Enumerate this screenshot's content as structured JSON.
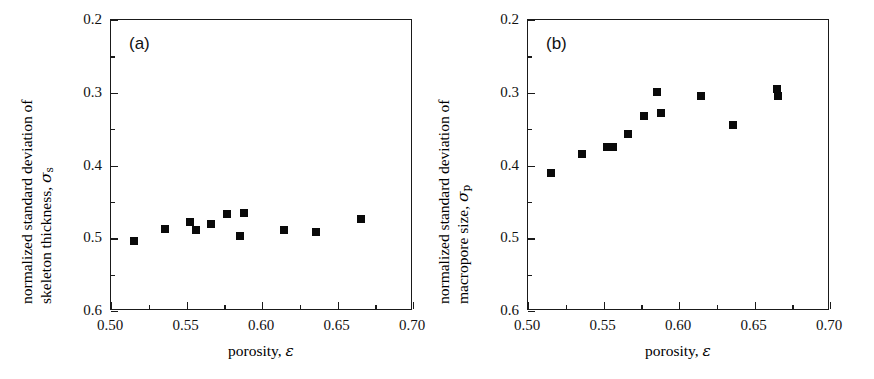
{
  "figure": {
    "background_color": "#ffffff",
    "marker_color": "#0a0a0a",
    "axis_color": "#1a1a1a"
  },
  "panels": [
    {
      "id": "a",
      "label": "(a)",
      "xlabel_prefix": "porosity, ",
      "xlabel_symbol": "ε",
      "ylabel_line1": "normalized standard deviation of",
      "ylabel_line2_prefix": "skeleton thickness, ",
      "ylabel_symbol": "σ",
      "ylabel_subscript": "s",
      "xticks": [
        "0.50",
        "0.55",
        "0.60",
        "0.65",
        "0.70"
      ],
      "yticks": [
        "0.6",
        "0.5",
        "0.4",
        "0.3",
        "0.2"
      ]
    },
    {
      "id": "b",
      "label": "(b)",
      "xlabel_prefix": "porosity, ",
      "xlabel_symbol": "ε",
      "ylabel_line1": "normalized standard deviation of",
      "ylabel_line2_prefix": "macropore size, ",
      "ylabel_symbol": "σ",
      "ylabel_subscript": "p",
      "xticks": [
        "0.50",
        "0.55",
        "0.60",
        "0.65",
        "0.70"
      ],
      "yticks": [
        "0.6",
        "0.5",
        "0.4",
        "0.3",
        "0.2"
      ]
    }
  ],
  "chart_data": [
    {
      "type": "scatter",
      "panel": "(a)",
      "title": "",
      "xlabel": "porosity, ε",
      "ylabel": "normalized standard deviation of skeleton thickness, σs",
      "xlim": [
        0.5,
        0.7
      ],
      "ylim": [
        0.2,
        0.6
      ],
      "xticks": [
        0.5,
        0.55,
        0.6,
        0.65,
        0.7
      ],
      "yticks": [
        0.2,
        0.3,
        0.4,
        0.5,
        0.6
      ],
      "xminor_ticks": [
        0.525,
        0.575,
        0.625,
        0.675
      ],
      "yminor_ticks": [
        0.25,
        0.35,
        0.45,
        0.55
      ],
      "grid": false,
      "legend": null,
      "series": [
        {
          "name": "skeleton thickness",
          "marker": "filled-square",
          "x": [
            0.5155,
            0.5355,
            0.5525,
            0.556,
            0.5665,
            0.577,
            0.5855,
            0.588,
            0.6145,
            0.6355,
            0.6655
          ],
          "y": [
            0.296,
            0.3125,
            0.3225,
            0.311,
            0.3195,
            0.334,
            0.303,
            0.335,
            0.312,
            0.308,
            0.3265
          ]
        }
      ]
    },
    {
      "type": "scatter",
      "panel": "(b)",
      "title": "",
      "xlabel": "porosity, ε",
      "ylabel": "normalized standard deviation of macropore size, σp",
      "xlim": [
        0.5,
        0.7
      ],
      "ylim": [
        0.2,
        0.6
      ],
      "xticks": [
        0.5,
        0.55,
        0.6,
        0.65,
        0.7
      ],
      "yticks": [
        0.2,
        0.3,
        0.4,
        0.5,
        0.6
      ],
      "xminor_ticks": [
        0.525,
        0.575,
        0.625,
        0.675
      ],
      "yminor_ticks": [
        0.25,
        0.35,
        0.45,
        0.55
      ],
      "grid": false,
      "legend": null,
      "series": [
        {
          "name": "macropore size",
          "marker": "filled-square",
          "x": [
            0.5155,
            0.5355,
            0.5525,
            0.556,
            0.5665,
            0.577,
            0.5855,
            0.588,
            0.6145,
            0.6355,
            0.665,
            0.6655
          ],
          "y": [
            0.39,
            0.4155,
            0.4255,
            0.4255,
            0.4435,
            0.468,
            0.5015,
            0.472,
            0.4955,
            0.456,
            0.5055,
            0.496
          ]
        }
      ]
    }
  ]
}
